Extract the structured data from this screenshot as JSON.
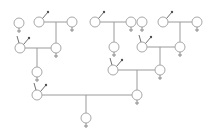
{
  "diagram": {
    "type": "pedigree",
    "colors": {
      "line": "#9a9a9a",
      "node": "#a8a8a8",
      "arrow": "#505050",
      "background": "#ffffff"
    },
    "node_radius": 5,
    "nodes": [
      {
        "id": "a",
        "sex": "female",
        "x": 19,
        "y": 23
      },
      {
        "id": "b",
        "sex": "male",
        "x": 39,
        "y": 22
      },
      {
        "id": "c",
        "sex": "female",
        "x": 72,
        "y": 22
      },
      {
        "id": "d",
        "sex": "female",
        "x": 56,
        "y": 48
      },
      {
        "id": "e",
        "sex": "male",
        "x": 20,
        "y": 48,
        "tick": true
      },
      {
        "id": "f",
        "sex": "female",
        "x": 37,
        "y": 72
      },
      {
        "id": "g",
        "sex": "male",
        "x": 37,
        "y": 95,
        "tick": true
      },
      {
        "id": "h",
        "sex": "female",
        "x": 86,
        "y": 118
      },
      {
        "id": "i",
        "sex": "female",
        "x": 137,
        "y": 95
      },
      {
        "id": "j",
        "sex": "male",
        "x": 113,
        "y": 70,
        "tick": true
      },
      {
        "id": "k",
        "sex": "female",
        "x": 160,
        "y": 70
      },
      {
        "id": "l",
        "sex": "male",
        "x": 95,
        "y": 22
      },
      {
        "id": "m",
        "sex": "female",
        "x": 131,
        "y": 22
      },
      {
        "id": "n",
        "sex": "female",
        "x": 114,
        "y": 47
      },
      {
        "id": "o",
        "sex": "female",
        "x": 142,
        "y": 22
      },
      {
        "id": "p",
        "sex": "male",
        "x": 163,
        "y": 22
      },
      {
        "id": "q",
        "sex": "female",
        "x": 197,
        "y": 22
      },
      {
        "id": "r",
        "sex": "male",
        "x": 142,
        "y": 47,
        "tick": true
      },
      {
        "id": "s",
        "sex": "female",
        "x": 180,
        "y": 47
      }
    ],
    "unions": [
      {
        "father": "b",
        "mother": "c",
        "child": "d",
        "drop_x": 56
      },
      {
        "father": "e",
        "mother": "d",
        "child": "f",
        "drop_x": 37
      },
      {
        "father": "g",
        "mother": "i",
        "child": "h",
        "drop_x": 86
      },
      {
        "father": "j",
        "mother": "k",
        "child": "i",
        "drop_x": 137
      },
      {
        "father": "l",
        "mother": "m",
        "child": "n",
        "drop_x": 114
      },
      {
        "father": "p",
        "mother": "q",
        "child": "s",
        "drop_x": 180
      },
      {
        "father": "r",
        "mother": "s",
        "child": "k",
        "drop_x": 160
      }
    ]
  }
}
